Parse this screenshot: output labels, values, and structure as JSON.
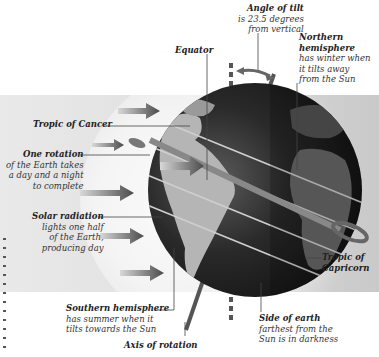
{
  "diagram": {
    "colors": {
      "background": "#ffffff",
      "sunlit_band": "#e2e2e2",
      "globe_dark": "#1e1e1e",
      "land_lit": "#b5b5b5",
      "arrow": "#555555",
      "leader_line": "#444444"
    },
    "labels": {
      "angle_of_tilt": {
        "title": "Angle of tilt",
        "lines": [
          "is 23.5 degrees",
          "from vertical"
        ]
      },
      "equator": {
        "title": "Equator"
      },
      "northern_hemisphere": {
        "title": "Northern",
        "title2": "hemisphere",
        "lines": [
          "has winter when",
          "it tilts away",
          "from the Sun"
        ]
      },
      "tropic_of_cancer": {
        "title": "Tropic of Cancer"
      },
      "one_rotation": {
        "title": "One rotation",
        "lines": [
          "of the Earth takes",
          "a day and a night",
          "to complete"
        ]
      },
      "solar_radiation": {
        "title": "Solar radiation",
        "lines": [
          "lights one half",
          "of the Earth,",
          "producing day"
        ]
      },
      "tropic_of_capricorn": {
        "title": "Tropic of",
        "title2": "Capricorn"
      },
      "southern_hemisphere": {
        "title": "Southern hemisphere",
        "lines": [
          "has summer when it",
          "tilts towards the Sun"
        ]
      },
      "side_of_earth": {
        "title": "Side of earth",
        "lines": [
          "farthest from the",
          "Sun is in darkness"
        ]
      },
      "axis_of_rotation": {
        "title": "Axis of rotation"
      }
    },
    "tilt_degrees": "23.5",
    "sun_arrows": 6
  }
}
